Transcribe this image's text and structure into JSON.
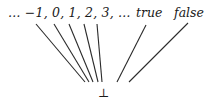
{
  "diagram": {
    "type": "flat-lattice",
    "top_nodes": {
      "integers": "… −1, 0, 1, 2, 3, …",
      "true": "true",
      "false": "false"
    },
    "bottom_node": "⊥",
    "edges": [
      {
        "from": "…",
        "to": "⊥"
      },
      {
        "from": "−1",
        "to": "⊥"
      },
      {
        "from": "0",
        "to": "⊥"
      },
      {
        "from": "1",
        "to": "⊥"
      },
      {
        "from": "2",
        "to": "⊥"
      },
      {
        "from": "3",
        "to": "⊥"
      },
      {
        "from": "true",
        "to": "⊥"
      },
      {
        "from": "false",
        "to": "⊥"
      }
    ]
  }
}
